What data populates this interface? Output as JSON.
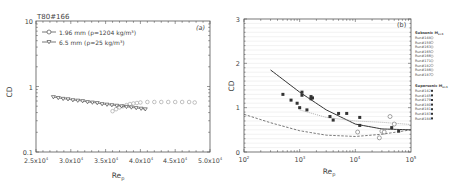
{
  "chart_data": [
    {
      "type": "line",
      "panel_label": "(a)",
      "title": "T80#166",
      "xlabel": "Re_p",
      "ylabel": "CD",
      "xscale": "linear",
      "yscale": "log",
      "xlim": [
        25000,
        50000
      ],
      "ylim": [
        0.1,
        10
      ],
      "xticks": [
        "2.5x10^4",
        "3.0x10^4",
        "3.5x10^4",
        "4.0x10^4",
        "4.5x10^4",
        "5.0x10^4"
      ],
      "yticks": [
        "0.1",
        "1",
        "10"
      ],
      "legend_position": "upper left",
      "series": [
        {
          "name": "1.96 mm (ρ=1204 kg/m³)",
          "marker": "circle-open",
          "x": [
            36000,
            36500,
            37000,
            37500,
            38000,
            38500,
            39000,
            39500,
            40000,
            41000,
            42000,
            43000,
            44000,
            45000,
            46000,
            47000,
            47800
          ],
          "y": [
            0.42,
            0.45,
            0.48,
            0.5,
            0.52,
            0.54,
            0.55,
            0.56,
            0.57,
            0.58,
            0.58,
            0.58,
            0.58,
            0.58,
            0.58,
            0.58,
            0.57
          ]
        },
        {
          "name": "6.5 mm (ρ=25 kg/m³)",
          "marker": "triangle-down-open",
          "x": [
            27500,
            28200,
            28900,
            29600,
            30300,
            31000,
            31700,
            32400,
            33100,
            33800,
            34500,
            35200,
            35900,
            36600,
            37300,
            38000,
            38700,
            39400,
            40100,
            40700
          ],
          "y": [
            0.69,
            0.67,
            0.65,
            0.64,
            0.62,
            0.61,
            0.6,
            0.58,
            0.57,
            0.56,
            0.54,
            0.53,
            0.52,
            0.51,
            0.5,
            0.49,
            0.48,
            0.47,
            0.46,
            0.45
          ]
        }
      ]
    },
    {
      "type": "scatter",
      "panel_label": "(b)",
      "xlabel": "Re_p",
      "ylabel": "CD",
      "xscale": "log",
      "yscale": "linear",
      "xlim": [
        100,
        100000
      ],
      "ylim": [
        0,
        3
      ],
      "xticks": [
        "10^2",
        "10^3",
        "10^4",
        "10^5"
      ],
      "yticks": [
        "0",
        "1",
        "2",
        "3"
      ],
      "grid": true,
      "legend_position": "right outside",
      "legend_groups": [
        {
          "title": "Subsonic M_s<1",
          "entries": [
            "Run#148",
            "Run#159",
            "Run#163",
            "Run#165",
            "Run#166",
            "Run#171",
            "Run#182",
            "Run#186",
            "Run#187"
          ]
        },
        {
          "title": "Supersonic M_s>1",
          "entries": [
            "Run#142",
            "Run#145",
            "Run#179",
            "Run#180",
            "Run#181",
            "Run#183",
            "Run#184"
          ]
        }
      ],
      "curves": [
        {
          "name": "solid correlation",
          "style": "solid",
          "x": [
            300,
            1000,
            3000,
            10000,
            30000,
            100000
          ],
          "y": [
            1.85,
            1.35,
            0.95,
            0.63,
            0.52,
            0.5
          ]
        },
        {
          "name": "dotted correlation",
          "style": "dotted",
          "x": [
            1000,
            3000,
            10000,
            30000,
            100000
          ],
          "y": [
            0.95,
            0.78,
            0.7,
            0.67,
            0.62
          ]
        },
        {
          "name": "dashed correlation",
          "style": "dashed",
          "x": [
            100,
            300,
            1000,
            3000,
            10000,
            30000,
            100000
          ],
          "y": [
            0.85,
            0.66,
            0.48,
            0.38,
            0.35,
            0.4,
            0.5
          ]
        }
      ],
      "points": [
        {
          "x": 1100,
          "y": 1.35
        },
        {
          "x": 1600,
          "y": 1.25
        },
        {
          "x": 1700,
          "y": 1.22
        },
        {
          "x": 1000,
          "y": 1.0
        },
        {
          "x": 1100,
          "y": 1.28
        },
        {
          "x": 700,
          "y": 1.17
        },
        {
          "x": 900,
          "y": 1.1
        },
        {
          "x": 1350,
          "y": 0.95
        },
        {
          "x": 1600,
          "y": 1.2
        },
        {
          "x": 500,
          "y": 1.3
        },
        {
          "x": 3500,
          "y": 0.8
        },
        {
          "x": 4000,
          "y": 0.72
        },
        {
          "x": 5000,
          "y": 0.87
        },
        {
          "x": 7000,
          "y": 0.87
        },
        {
          "x": 12000,
          "y": 0.78
        },
        {
          "x": 12000,
          "y": 0.6
        },
        {
          "x": 11000,
          "y": 0.45
        },
        {
          "x": 30000,
          "y": 0.47
        },
        {
          "x": 33000,
          "y": 0.45
        },
        {
          "x": 42000,
          "y": 0.8
        },
        {
          "x": 45000,
          "y": 0.55
        },
        {
          "x": 50000,
          "y": 0.63
        },
        {
          "x": 60000,
          "y": 0.47
        },
        {
          "x": 27000,
          "y": 0.32
        }
      ]
    }
  ],
  "left": {
    "title": "T80#166",
    "panel": "(a)",
    "ylabel": "CD",
    "xlabel": "Re",
    "xlabel_sub": "p",
    "legend": [
      {
        "label": "1.96 mm (ρ=1204 kg/m³)"
      },
      {
        "label": "6.5 mm (ρ=25 kg/m³)"
      }
    ],
    "yticks": [
      {
        "v": "10",
        "y": 21
      },
      {
        "v": "1",
        "y": 87
      },
      {
        "v": "0.1",
        "y": 152
      }
    ],
    "xticks": [
      {
        "m": "2.5x10",
        "e": "4",
        "x": 36
      },
      {
        "m": "3.0x10",
        "e": "4",
        "x": 71
      },
      {
        "m": "3.5x10",
        "e": "4",
        "x": 106
      },
      {
        "m": "4.0x10",
        "e": "4",
        "x": 141
      },
      {
        "m": "4.5x10",
        "e": "4",
        "x": 175
      },
      {
        "m": "5.0x10",
        "e": "4",
        "x": 210
      }
    ]
  },
  "right": {
    "panel": "(b)",
    "ylabel": "CD",
    "xlabel": "Re",
    "xlabel_sub": "p",
    "yticks": [
      {
        "v": "3",
        "y": 19
      },
      {
        "v": "2",
        "y": 63
      },
      {
        "v": "1",
        "y": 107
      },
      {
        "v": "0",
        "y": 152
      }
    ],
    "xticks": [
      {
        "m": "10",
        "e": "2",
        "x": 244
      },
      {
        "m": "10",
        "e": "3",
        "x": 300
      },
      {
        "m": "10",
        "e": "4",
        "x": 355
      },
      {
        "m": "10",
        "e": "5",
        "x": 411
      }
    ],
    "legend_sub_title": "Subsonic M",
    "legend_sub_cond": "s<1",
    "legend_sup_title": "Supersonic M",
    "legend_sup_cond": "s>1",
    "sub_runs": [
      "Run#148",
      "Run#159",
      "Run#163",
      "Run#165",
      "Run#166",
      "Run#171",
      "Run#182",
      "Run#186",
      "Run#187"
    ],
    "sup_runs": [
      "Run#142",
      "Run#145",
      "Run#179",
      "Run#180",
      "Run#181",
      "Run#183",
      "Run#184"
    ]
  }
}
